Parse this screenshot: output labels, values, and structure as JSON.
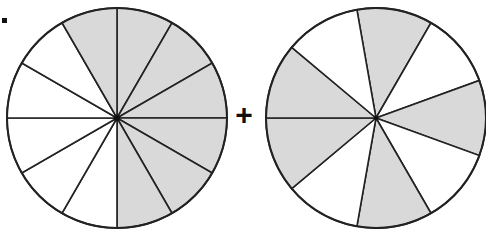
{
  "diagram": {
    "type": "fraction-addition-pie-diagram",
    "operator": "+",
    "label_marker": ".",
    "colors": {
      "shaded": "#d9d9d9",
      "unshaded": "#ffffff",
      "stroke": "#222222"
    },
    "circles": [
      {
        "name": "left-circle",
        "cx": 117,
        "cy": 118,
        "r": 110,
        "slices": 12,
        "shaded_slices": 7,
        "fraction": "7/12",
        "shaded_indices_clockwise_from_top": [
          0,
          1,
          2,
          3,
          4,
          5,
          11
        ]
      },
      {
        "name": "right-circle",
        "cx": 376,
        "cy": 118,
        "r": 110,
        "slices": 9,
        "shaded_slices": 5,
        "fraction": "5/9",
        "start_angle_deg": -10,
        "shaded_indices_clockwise_from_start": [
          0,
          2,
          4,
          6,
          7
        ]
      }
    ]
  }
}
